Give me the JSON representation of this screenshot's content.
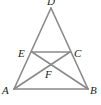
{
  "diagram": {
    "type": "geometry",
    "points": {
      "D": {
        "label": "D",
        "x": 51,
        "y": 8
      },
      "E": {
        "label": "E",
        "x": 32,
        "y": 52
      },
      "C": {
        "label": "C",
        "x": 70,
        "y": 52
      },
      "F": {
        "label": "F",
        "x": 51,
        "y": 64
      },
      "A": {
        "label": "A",
        "x": 14,
        "y": 89
      },
      "B": {
        "label": "B",
        "x": 88,
        "y": 89
      }
    },
    "segments": [
      "DA",
      "DB",
      "AB",
      "EC",
      "AC",
      "EB"
    ],
    "labels": {
      "D": "D",
      "E": "E",
      "C": "C",
      "F": "F",
      "A": "A",
      "B": "B"
    },
    "line_color": "#8a8a8a"
  }
}
